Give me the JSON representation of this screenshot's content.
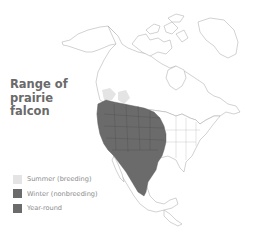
{
  "map": {
    "title_lines": [
      "Range of",
      "prairie",
      "falcon"
    ],
    "species": "prairie falcon",
    "region": "North America",
    "legend": [
      {
        "label": "Summer (breeding)",
        "color": "#e4e4e4"
      },
      {
        "label": "Winter (nonbreeding)",
        "color": "#6b6b6b"
      },
      {
        "label": "Year-round",
        "color": "#6b6b6b"
      }
    ],
    "colors": {
      "range_fill": "#6b6b6b",
      "summer_fill": "#e4e4e4",
      "outline": "#9a9a9a",
      "land": "#ffffff"
    }
  }
}
